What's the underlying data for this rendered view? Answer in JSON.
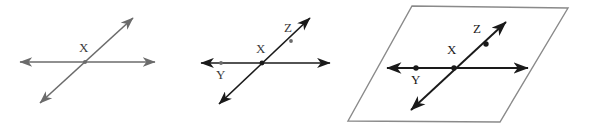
{
  "image": {
    "title": "Three geometry diagrams of intersecting lines",
    "width": 590,
    "height": 127,
    "background_color": "#ffffff"
  },
  "colors": {
    "line_light": "#6b6b6b",
    "line_dark": "#1a1a1a",
    "plane_edge": "#8a8a8a",
    "label_light": "#3a3a3a",
    "label_dark": "#111111"
  },
  "figures": [
    {
      "id": "figure-1",
      "name": "two-intersecting-lines",
      "labels": [
        {
          "name": "point-x",
          "text": "X",
          "x": 79,
          "y": 52,
          "tone": "light"
        }
      ],
      "lines": [
        {
          "name": "horizontal-line",
          "x1": 20,
          "y1": 62,
          "x2": 155,
          "y2": 62,
          "arrow_start": true,
          "arrow_end": true,
          "tone": "light",
          "width": 1.6
        },
        {
          "name": "diagonal-line",
          "x1": 40,
          "y1": 103,
          "x2": 133,
          "y2": 18,
          "arrow_start": true,
          "arrow_end": true,
          "tone": "light",
          "width": 1.6
        }
      ],
      "dots": [
        {
          "name": "intersection-dot-x",
          "cx": 85,
          "cy": 62,
          "r": 2.0,
          "tone": "light"
        }
      ]
    },
    {
      "id": "figure-2",
      "name": "labeled-intersecting-lines",
      "labels": [
        {
          "name": "point-x",
          "text": "X",
          "x": 256,
          "y": 53,
          "tone": "light"
        },
        {
          "name": "point-y",
          "text": "Y",
          "x": 216,
          "y": 79,
          "tone": "light"
        },
        {
          "name": "point-z",
          "text": "Z",
          "x": 284,
          "y": 32,
          "tone": "light"
        }
      ],
      "lines": [
        {
          "name": "horizontal-line",
          "x1": 201,
          "y1": 63,
          "x2": 330,
          "y2": 63,
          "arrow_start": true,
          "arrow_end": true,
          "tone": "dark",
          "width": 1.7
        },
        {
          "name": "diagonal-line",
          "x1": 219,
          "y1": 104,
          "x2": 310,
          "y2": 18,
          "arrow_start": true,
          "arrow_end": true,
          "tone": "dark",
          "width": 1.7
        }
      ],
      "dots": [
        {
          "name": "intersection-dot-x",
          "cx": 262,
          "cy": 63,
          "r": 2.4,
          "tone": "dark"
        },
        {
          "name": "point-dot-y",
          "cx": 221,
          "cy": 63,
          "r": 1.9,
          "tone": "light"
        },
        {
          "name": "point-dot-z",
          "cx": 291,
          "cy": 41,
          "r": 1.9,
          "tone": "light"
        }
      ]
    },
    {
      "id": "figure-3",
      "name": "lines-in-plane",
      "plane": {
        "name": "plane-parallelogram",
        "points": "412,6 568,8 500,122 348,121",
        "fill": "#ffffff",
        "stroke": "#8a8a8a",
        "stroke_width": 1.4
      },
      "labels": [
        {
          "name": "point-x",
          "text": "X",
          "x": 447,
          "y": 54,
          "tone": "dark"
        },
        {
          "name": "point-y",
          "text": "Y",
          "x": 411,
          "y": 84,
          "tone": "dark"
        },
        {
          "name": "point-z",
          "text": "Z",
          "x": 473,
          "y": 33,
          "tone": "dark"
        }
      ],
      "lines": [
        {
          "name": "horizontal-line",
          "x1": 387,
          "y1": 68,
          "x2": 528,
          "y2": 68,
          "arrow_start": true,
          "arrow_end": true,
          "tone": "dark",
          "width": 1.9
        },
        {
          "name": "diagonal-line",
          "x1": 411,
          "y1": 110,
          "x2": 506,
          "y2": 22,
          "arrow_start": true,
          "arrow_end": true,
          "tone": "dark",
          "width": 1.9
        }
      ],
      "dots": [
        {
          "name": "intersection-dot-x",
          "cx": 454,
          "cy": 68,
          "r": 2.7,
          "tone": "dark"
        },
        {
          "name": "point-dot-y",
          "cx": 416,
          "cy": 68,
          "r": 2.7,
          "tone": "dark"
        },
        {
          "name": "point-dot-z",
          "cx": 486,
          "cy": 44,
          "r": 2.7,
          "tone": "dark"
        }
      ]
    }
  ]
}
